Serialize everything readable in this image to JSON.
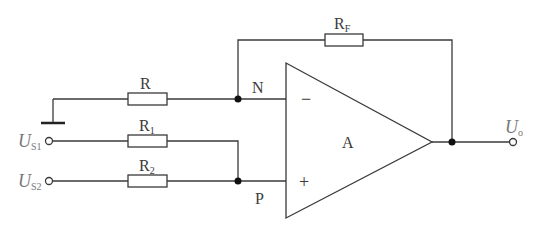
{
  "diagram": {
    "type": "op-amp circuit",
    "components": {
      "feedback_resistor": {
        "label": "R",
        "sub": "F"
      },
      "ground_resistor": {
        "label": "R"
      },
      "input_resistor_1": {
        "label": "R",
        "sub": "1"
      },
      "input_resistor_2": {
        "label": "R",
        "sub": "2"
      },
      "opamp": {
        "label": "A",
        "inverting_sign": "−",
        "noninverting_sign": "+"
      }
    },
    "nodes": {
      "inverting": "N",
      "noninverting": "P"
    },
    "terminals": {
      "source1": {
        "label": "U",
        "sub": "S1"
      },
      "source2": {
        "label": "U",
        "sub": "S2"
      },
      "output": {
        "label": "U",
        "sub": "o"
      }
    }
  }
}
